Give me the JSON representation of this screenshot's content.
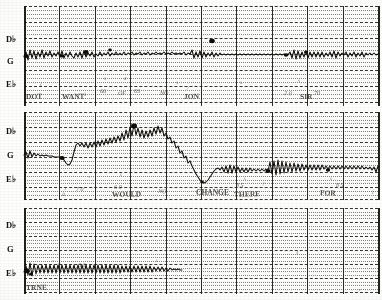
{
  "sheet": {
    "kind": "chart-recorder-strip",
    "bands": 3,
    "columns": 10,
    "ink_color": "#100e0a",
    "paper_color": "#fdfdfb"
  },
  "margin_labels": {
    "top": [
      "D♭",
      "G",
      "E♭"
    ],
    "middle": [
      "D♭",
      "G",
      "E♭"
    ],
    "bottom": [
      "D♭",
      "G",
      "E♭"
    ]
  },
  "annotations": {
    "band1": [
      {
        "text": "DOT",
        "x": 26,
        "y": 92
      },
      {
        "text": "s",
        "x": 40,
        "y": 82
      },
      {
        "text": "WANT",
        "x": 62,
        "y": 92
      },
      {
        "text": "1",
        "x": 84,
        "y": 92
      },
      {
        "text": "s",
        "x": 104,
        "y": 76
      },
      {
        "text": "4",
        "x": 124,
        "y": 76
      },
      {
        "text": "66",
        "x": 100,
        "y": 88
      },
      {
        "text": "OF",
        "x": 118,
        "y": 90
      },
      {
        "text": "6S",
        "x": 134,
        "y": 88
      },
      {
        "text": "NO",
        "x": 160,
        "y": 90
      },
      {
        "text": "s",
        "x": 176,
        "y": 80
      },
      {
        "text": "7",
        "x": 186,
        "y": 86
      },
      {
        "text": "JON",
        "x": 184,
        "y": 92
      },
      {
        "text": "s",
        "x": 240,
        "y": 80
      },
      {
        "text": "2 0",
        "x": 284,
        "y": 90
      },
      {
        "text": "s",
        "x": 298,
        "y": 78
      },
      {
        "text": "SIR",
        "x": 300,
        "y": 92
      },
      {
        "text": "70",
        "x": 314,
        "y": 90
      }
    ],
    "band2": [
      {
        "text": "1",
        "x": 64,
        "y": 186
      },
      {
        "text": "B",
        "x": 62,
        "y": 192
      },
      {
        "text": "7 0",
        "x": 76,
        "y": 186
      },
      {
        "text": "s",
        "x": 88,
        "y": 174
      },
      {
        "text": "6 0",
        "x": 114,
        "y": 184
      },
      {
        "text": "WOULD",
        "x": 112,
        "y": 190
      },
      {
        "text": "s",
        "x": 120,
        "y": 172
      },
      {
        "text": "NO",
        "x": 158,
        "y": 188
      },
      {
        "text": "CHANGE",
        "x": 196,
        "y": 188
      },
      {
        "text": "s",
        "x": 244,
        "y": 176
      },
      {
        "text": "8 5",
        "x": 236,
        "y": 182
      },
      {
        "text": "THERE",
        "x": 234,
        "y": 190
      },
      {
        "text": "7",
        "x": 262,
        "y": 182
      },
      {
        "text": "FOR",
        "x": 320,
        "y": 188
      },
      {
        "text": "s",
        "x": 330,
        "y": 176
      },
      {
        "text": "8 5",
        "x": 336,
        "y": 182
      },
      {
        "text": "I",
        "x": 372,
        "y": 190
      }
    ],
    "band3": [
      {
        "text": "TRNE",
        "x": 26,
        "y": 283
      },
      {
        "text": "s",
        "x": 52,
        "y": 258
      },
      {
        "text": "6",
        "x": 58,
        "y": 262
      },
      {
        "text": "6 0",
        "x": 78,
        "y": 262
      },
      {
        "text": "s",
        "x": 130,
        "y": 258
      },
      {
        "text": "s",
        "x": 156,
        "y": 258
      },
      {
        "text": "7",
        "x": 358,
        "y": 288
      },
      {
        "text": "4",
        "x": 296,
        "y": 250
      }
    ]
  },
  "chart_data": {
    "type": "line",
    "title": "",
    "xlabel": "",
    "ylabel": "",
    "grid": true,
    "legend": null,
    "bands": [
      {
        "name": "band-1",
        "baseline_label": "G",
        "x_range": [
          24,
          378
        ],
        "series": [
          {
            "name": "pen-trace-1",
            "points": "24,57 26,52 28,60 30,50 32,58 34,51 36,59 38,52 40,57 42,50 44,58 46,52 48,56 50,51 52,57 54,53 56,56 58,52 60,57 62,51 64,58 66,53 68,57 70,52 72,56 74,58 76,53 78,57 80,52 82,58 84,51 86,57 88,53 90,56 92,52 94,57 96,54 98,56 100,52 102,56 104,53 106,55 108,52 110,56 112,53 114,55 116,52 118,55 120,53 122,55 124,52 126,55 128,53 130,54 132,52 134,55 136,53 138,54 140,52 142,55 144,53 146,54 148,52 150,55 152,53 154,54 156,52 158,54 160,53 162,54 164,52 166,54 168,53 170,54 172,52 174,54 176,53 178,54 180,53 182,54 184,52 186,55 188,53 190,54"
          },
          {
            "name": "pen-trace-2",
            "points": "190,54 192,50 194,58 196,52 198,57 200,51 202,58 204,52 206,57 208,53 210,56 212,52 214,57 216,53 218,56 220,53 222,55 224,54 226,55 228,54 230,55 232,54 234,55 236,54 238,55 240,54 242,55 244,54 246,55 248,54 250,55 252,54 254,55 256,54 258,55 260,54 262,55 264,54 266,55 268,54 270,55 272,54 274,55 276,54 278,55 280,54 282,55 284,54 286,55 288,54"
          },
          {
            "name": "pen-trace-3",
            "points": "288,55 290,52 292,58 294,50 296,59 298,51 300,58 302,52 304,57 306,51 308,58 310,52 312,57 314,52 316,57 318,52 320,57 322,52 324,57 326,53 328,56 330,52 332,57 334,51 336,58 338,52 340,56 342,53 344,55 346,52 348,57 350,53 352,56 354,52 356,57 358,53 360,56 362,52 364,57 366,53 368,55 370,53 372,55 374,53 376,55 378,54"
          }
        ],
        "markers": [
          {
            "x": 26,
            "y": 56,
            "r": 2.4
          },
          {
            "x": 62,
            "y": 56,
            "r": 2.0
          },
          {
            "x": 86,
            "y": 52,
            "r": 2.6
          },
          {
            "x": 110,
            "y": 50,
            "r": 1.8
          },
          {
            "x": 212,
            "y": 41,
            "r": 2.8
          },
          {
            "x": 286,
            "y": 55,
            "r": 2.2
          },
          {
            "x": 306,
            "y": 52,
            "r": 2.0
          }
        ]
      },
      {
        "name": "band-2",
        "baseline_label": "G",
        "x_range": [
          24,
          378
        ],
        "series": [
          {
            "name": "pen-trace-1",
            "points": "24,155 26,152 28,158 30,151 32,157 34,153 36,156 38,154 40,156 42,155 44,156 46,155 48,156 50,156 52,156 54,157 56,157 58,157 60,157 62,157"
          },
          {
            "name": "pen-trace-ramp",
            "points": "62,157 64,160 66,163 68,165 70,164 72,160 74,152 76,145 78,143 80,146 82,143 84,147 86,143 88,148 90,143 92,147 94,142 96,147 98,141 100,146 102,140 104,145 106,139 108,144 110,138 112,143 114,137 116,142 118,136 120,141 122,133 124,140 126,130 128,138 130,127 132,136 134,124 136,135 138,128 140,137 142,130 144,138 146,131 148,137 150,130 152,136 154,128 156,134 158,126 160,133 162,128 164,136 166,133 168,139 170,137 172,143 174,141 176,148 178,146 180,153 182,151 184,158 186,156 188,163 190,161"
          },
          {
            "name": "pen-trace-descent",
            "points": "190,161 192,166 194,170 196,174 198,177 200,180 202,182 204,183 206,182 208,180 210,177 212,174 214,171 216,169 218,168 220,170 222,167 224,172 226,166 228,173 230,165 232,173 234,166 236,172 238,167 240,172 242,168 244,172 246,168 248,172 250,168 252,171 254,169 256,171 258,169 260,171 262,169 264,171 266,169 268,171"
          },
          {
            "name": "pen-trace-osc",
            "points": "268,171 270,162 272,174 274,161 276,175 278,160 280,174 282,161 284,173 286,162 288,172 290,163 292,172 294,163 296,171 298,164 300,171 302,164 304,170 306,165 308,170 310,165 312,170 314,165 316,170 318,165 320,170 322,165 324,169 326,166 328,169 330,166 332,169 334,166 336,169 338,166 340,169 342,166 344,169 346,166 348,169 350,166 352,169 354,166 356,169 358,166 360,169 362,166 364,169 366,167 368,169 370,167 372,170 374,167 376,172 378,166"
          }
        ],
        "markers": [
          {
            "x": 62,
            "y": 158,
            "r": 2.6
          },
          {
            "x": 134,
            "y": 126,
            "r": 3.0
          },
          {
            "x": 202,
            "y": 182,
            "r": 1.8
          },
          {
            "x": 268,
            "y": 171,
            "r": 2.6
          },
          {
            "x": 328,
            "y": 170,
            "r": 2.2
          }
        ]
      },
      {
        "name": "band-3",
        "baseline_label": "E♭",
        "x_range": [
          24,
          378
        ],
        "series": [
          {
            "name": "pen-trace-1",
            "points": "24,272 26,266 28,275 30,263 32,276 34,264 36,274 38,265 40,273 42,265 44,273 46,265 48,273 50,265 52,273 54,265 56,273 58,265 60,273 62,265 64,273 66,265 68,273 70,265 72,273 74,265 76,273 78,265 80,273 82,265 84,273 86,265 88,273 90,265 92,273 94,265 96,273 98,265 100,273 102,265 104,273 106,265 108,273 110,265 112,273 114,265 116,273 118,265 120,273 122,266 124,272 126,266 128,272 130,266 132,272 134,266 136,272 138,266 140,272 142,266 144,272 146,266 148,272 150,266 152,272 154,267 156,271 158,267 160,271 162,267 164,271 166,268 168,271 170,268 172,270 174,269 176,270 178,269 180,270 182,270"
          }
        ],
        "markers": [
          {
            "x": 27,
            "y": 271,
            "r": 2.8
          },
          {
            "x": 31,
            "y": 274,
            "r": 2.0
          }
        ]
      }
    ]
  }
}
